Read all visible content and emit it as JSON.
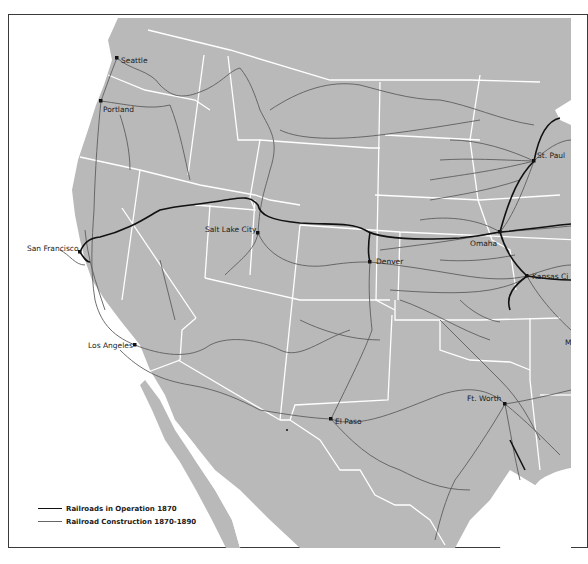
{
  "map": {
    "subject": "Western United States railroads",
    "colors": {
      "land": "#b9b9b9",
      "water": "#ffffff",
      "state_borders": "#ffffff",
      "operation_1870": "#111111",
      "construction_1870_1890": "#5e5e5e"
    },
    "cities": [
      {
        "name": "Seattle",
        "x": 117,
        "y": 58
      },
      {
        "name": "Portland",
        "x": 101,
        "y": 101
      },
      {
        "name": "San Francisco",
        "x": 80,
        "y": 252
      },
      {
        "name": "Salt Lake City",
        "x": 258,
        "y": 233
      },
      {
        "name": "Denver",
        "x": 370,
        "y": 262
      },
      {
        "name": "Omaha",
        "x": 500,
        "y": 232
      },
      {
        "name": "St. Paul",
        "x": 534,
        "y": 161
      },
      {
        "name": "Kansas City",
        "x": 527,
        "y": 276
      },
      {
        "name": "Los Angeles",
        "x": 135,
        "y": 345
      },
      {
        "name": "El Paso",
        "x": 331,
        "y": 419
      },
      {
        "name": "Ft. Worth",
        "x": 505,
        "y": 404
      }
    ],
    "partial_labels": [
      {
        "text": "St. Paul",
        "shown": "St. Paul"
      },
      {
        "text": "Kansas City",
        "shown": "Kansas Ci"
      },
      {
        "text": "M",
        "shown": "M"
      }
    ]
  },
  "legend": {
    "items": [
      {
        "label": "Railroads in Operation 1870",
        "style": "thick-black"
      },
      {
        "label": "Railroad Construction 1870-1890",
        "style": "thin-gray"
      }
    ]
  }
}
